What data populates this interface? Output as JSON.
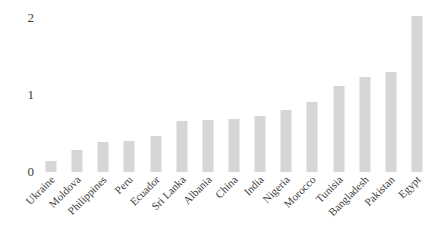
{
  "chart_data": {
    "type": "bar",
    "title": "",
    "subtitle": "",
    "xlabel": "",
    "ylabel": "",
    "categories": [
      "Ukraine",
      "Moldova",
      "Philippines",
      "Peru",
      "Ecuador",
      "Sri Lanka",
      "Albania",
      "China",
      "India",
      "Nigeria",
      "Morocco",
      "Tunisia",
      "Bangladesh",
      "Pakistan",
      "Egypt"
    ],
    "values": [
      0.13,
      0.27,
      0.37,
      0.38,
      0.44,
      0.63,
      0.64,
      0.65,
      0.69,
      0.76,
      0.86,
      1.06,
      1.17,
      1.23,
      1.92
    ],
    "ylim": [
      0,
      2
    ],
    "yticks": [
      0,
      1,
      2
    ],
    "ytick_labels": [
      "0",
      "1",
      "2"
    ],
    "grid": false,
    "legend": false,
    "legend_position": "none",
    "bar_color": "#d6d6d6",
    "text_color": "#3d3d3d",
    "background_color": "#ffffff"
  }
}
